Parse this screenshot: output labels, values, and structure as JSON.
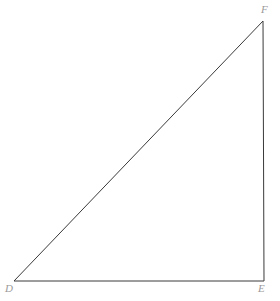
{
  "figure": {
    "background_color": "#ffffff",
    "width": 280,
    "height": 301
  },
  "geometry": {
    "shape": "triangle",
    "stroke_color": "#3a3a3a",
    "stroke_width": 1,
    "fill": "none",
    "polygon_points": "14,281 264,281 263,21",
    "vertices": [
      {
        "name": "D",
        "x": 14,
        "y": 281,
        "label": "D",
        "label_position": "below-left"
      },
      {
        "name": "E",
        "x": 264,
        "y": 281,
        "label": "E",
        "label_position": "below-right"
      },
      {
        "name": "F",
        "x": 263,
        "y": 21,
        "label": "F",
        "label_position": "above-right"
      }
    ],
    "edges": [
      {
        "name": "base",
        "from": "D",
        "to": "E",
        "x1": 14,
        "y1": 281,
        "x2": 264,
        "y2": 281
      },
      {
        "name": "vertical",
        "from": "E",
        "to": "F",
        "x1": 264,
        "y1": 281,
        "x2": 263,
        "y2": 21
      },
      {
        "name": "hypotenuse",
        "from": "F",
        "to": "D",
        "x1": 263,
        "y1": 21,
        "x2": 14,
        "y2": 281
      }
    ]
  },
  "labels": {
    "d": "D",
    "e": "E",
    "f": "F",
    "color": "#9a9a9a"
  }
}
